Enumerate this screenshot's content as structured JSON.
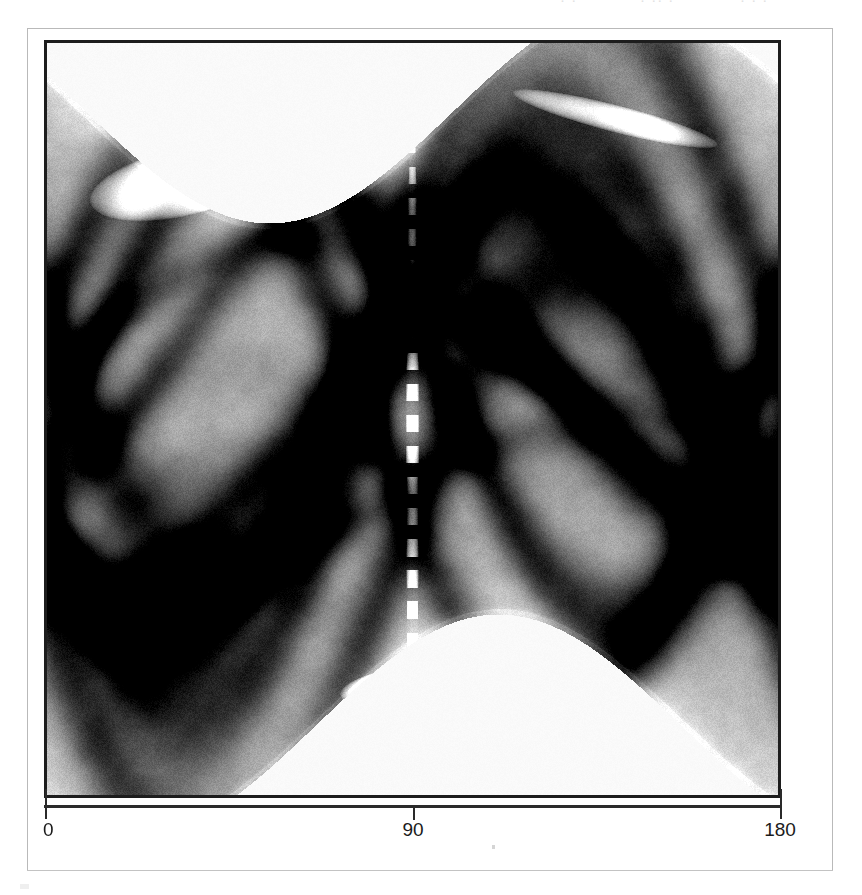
{
  "figure": {
    "kind": "sinogram",
    "border_color": "#b9b9b9",
    "frame_color": "#1d1d1d",
    "background": "#ffffff"
  },
  "axes": {
    "x": {
      "label": "",
      "min": 0,
      "max": 180,
      "ticks": [
        {
          "value": 0,
          "label": "0",
          "px": 45
        },
        {
          "value": 90,
          "label": "90",
          "px": 413
        },
        {
          "value": 180,
          "label": "180",
          "px": 780
        }
      ]
    },
    "y": {
      "label": "",
      "visible_ticks": false
    }
  },
  "scan_artifacts": {
    "top_text_fragments": [
      {
        "text": "· ·",
        "left": 560
      },
      {
        "text": "·  ·· ·",
        "left": 640
      },
      {
        "text": "· · ·",
        "left": 740
      }
    ]
  },
  "chart_data": {
    "type": "heatmap",
    "title": "",
    "subtitle": "",
    "xlabel": "",
    "ylabel": "",
    "xlim": [
      0,
      180
    ],
    "ylim": [
      0,
      1
    ],
    "grid": false,
    "legend": "none",
    "colormap": "grayscale-inverted",
    "xtick_labels": [
      "0",
      "90",
      "180"
    ],
    "xtick_values": [
      0,
      90,
      180
    ],
    "ytick_labels": [],
    "sinusoid_traces": [
      {
        "name": "outer-envelope-upper",
        "amplitude": 0.4,
        "phase_deg": 10,
        "offset": 0.3,
        "width": 0.085,
        "intensity": 0.82
      },
      {
        "name": "outer-envelope-lower",
        "amplitude": 0.4,
        "phase_deg": 10,
        "offset": 0.7,
        "width": 0.085,
        "intensity": 0.82
      },
      {
        "name": "major-band-1",
        "amplitude": 0.33,
        "phase_deg": 165,
        "offset": 0.45,
        "width": 0.06,
        "intensity": 0.95
      },
      {
        "name": "major-band-2",
        "amplitude": 0.3,
        "phase_deg": 35,
        "offset": 0.5,
        "width": 0.055,
        "intensity": 0.9
      },
      {
        "name": "mid-band-3",
        "amplitude": 0.22,
        "phase_deg": 120,
        "offset": 0.42,
        "width": 0.045,
        "intensity": 0.65
      },
      {
        "name": "mid-band-4",
        "amplitude": 0.18,
        "phase_deg": 70,
        "offset": 0.55,
        "width": 0.04,
        "intensity": 0.6
      },
      {
        "name": "inner-ellipse-a",
        "amplitude": 0.12,
        "phase_deg": 150,
        "offset": 0.38,
        "width": 0.03,
        "intensity": 0.45
      },
      {
        "name": "inner-ellipse-b",
        "amplitude": 0.1,
        "phase_deg": 20,
        "offset": 0.62,
        "width": 0.028,
        "intensity": 0.42
      }
    ],
    "bright_features": [
      {
        "name": "upper-left-highlight",
        "x_deg": 33,
        "y_frac": 0.185,
        "rx_deg": 23,
        "ry_frac": 0.045,
        "angle_deg": -12,
        "strength": 1.0
      },
      {
        "name": "center-dashed-streak",
        "x_deg": 90,
        "y_frac": 0.55,
        "rx_deg": 1.6,
        "ry_frac": 0.47,
        "angle_deg": 0,
        "strength": 0.95,
        "dashed": true
      },
      {
        "name": "bottom-center-wedge",
        "x_deg": 85,
        "y_frac": 0.855,
        "rx_deg": 13,
        "ry_frac": 0.022,
        "angle_deg": -10,
        "strength": 1.0
      },
      {
        "name": "upper-right-arcs",
        "x_deg": 140,
        "y_frac": 0.1,
        "rx_deg": 26,
        "ry_frac": 0.018,
        "angle_deg": 14,
        "strength": 0.8
      }
    ]
  }
}
